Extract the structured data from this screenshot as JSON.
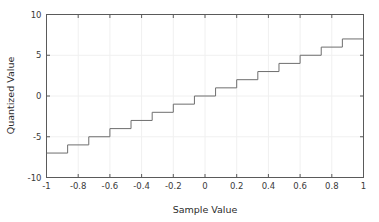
{
  "chart_data": {
    "type": "line",
    "title": "",
    "subtitle": "",
    "xlabel": "Sample Value",
    "ylabel": "Quantized Value",
    "xlim": [
      -1,
      1
    ],
    "ylim": [
      -10,
      10
    ],
    "xticks": [
      -1,
      -0.8,
      -0.6,
      -0.4,
      -0.2,
      0,
      0.2,
      0.4,
      0.6,
      0.8,
      1
    ],
    "xticklabels": [
      "-1",
      "-0.8",
      "-0.6",
      "-0.4",
      "-0.2",
      "0",
      "0.2",
      "0.4",
      "0.6",
      "0.8",
      "1"
    ],
    "yticks": [
      -10,
      -5,
      0,
      5,
      10
    ],
    "yticklabels": [
      "-10",
      "-5",
      "0",
      "5",
      "10"
    ],
    "grid": true,
    "legend": false,
    "line_color": "#6e6e6e",
    "line_width": 1,
    "grid_color": "#f0f0f0",
    "axis_color": "#5a5a5a",
    "background": "#ffffff",
    "step_style": "post",
    "series": [
      {
        "name": "Quantizer staircase",
        "x": [
          -1.0,
          -0.8667,
          -0.7333,
          -0.6,
          -0.4667,
          -0.3333,
          -0.2,
          -0.0667,
          0.0667,
          0.2,
          0.3333,
          0.4667,
          0.6,
          0.7333,
          0.8667,
          1.0
        ],
        "values": [
          -7,
          -6,
          -5,
          -4,
          -3,
          -2,
          -1,
          0,
          1,
          2,
          3,
          4,
          5,
          6,
          7,
          7
        ]
      }
    ],
    "step_count": 15,
    "step_width": 0.1333,
    "level_min": -7,
    "level_max": 7
  }
}
